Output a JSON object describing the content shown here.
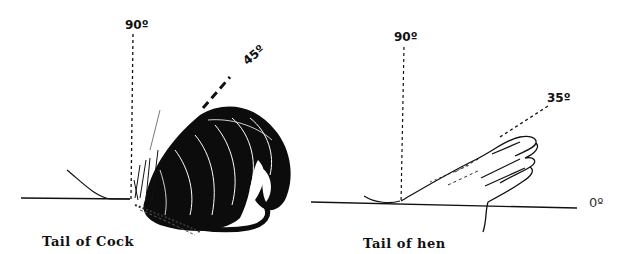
{
  "figure": {
    "panels": [
      {
        "id": "cock",
        "caption": "Tail of Cock",
        "vertical_label": "90º",
        "angle_label": "45º",
        "tail_angle_deg": 45
      },
      {
        "id": "hen",
        "caption": "Tail of hen",
        "vertical_label": "90º",
        "angle_label": "35º",
        "baseline_label": "0º",
        "tail_angle_deg": 35
      }
    ],
    "colors": {
      "ink": "#111111",
      "background": "#ffffff"
    }
  }
}
